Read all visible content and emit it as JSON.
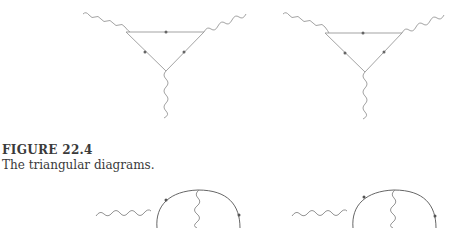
{
  "figure": {
    "label": "FIGURE 22.4",
    "caption": "The triangular diagrams."
  },
  "diagrams": {
    "top_left": {
      "type": "triangle-loop",
      "photons": 3,
      "fermion_arrows": 3,
      "orientation": "counter-clockwise"
    },
    "top_right": {
      "type": "triangle-loop",
      "photons": 3,
      "fermion_arrows": 3,
      "orientation": "clockwise"
    },
    "bottom_left": {
      "type": "self-energy-loop",
      "photons": 2,
      "partially_visible": true
    },
    "bottom_right": {
      "type": "self-energy-loop",
      "photons": 2,
      "partially_visible": true
    }
  },
  "colors": {
    "line": "#8a8a8a",
    "loop": "#555555",
    "text": "#3a3a3a"
  }
}
